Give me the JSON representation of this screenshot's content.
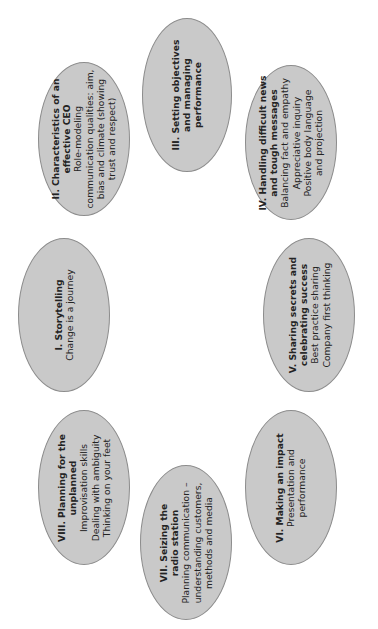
{
  "diagram": {
    "type": "cycle",
    "orientation": "rotated-90-ccw",
    "colors": {
      "background": "#ffffff",
      "ellipse_fill": "#c9c9c9",
      "ellipse_border": "#8c8c8c",
      "text": "#232323"
    },
    "nodes": [
      {
        "id": "I",
        "title_lines": [
          "I. Storytelling"
        ],
        "body_lines": [
          "Change is a journey"
        ]
      },
      {
        "id": "II",
        "title_lines": [
          "II. Characteristics of an",
          "effective CEO"
        ],
        "body_lines": [
          "Role-modeling",
          "communication qualities: aim,",
          "bias and climate (showing",
          "trust and respect)"
        ]
      },
      {
        "id": "III",
        "title_lines": [
          "III. Setting objectives",
          "and managing",
          "performance"
        ],
        "body_lines": []
      },
      {
        "id": "IV",
        "title_lines": [
          "IV. Handling difficult news",
          "and tough messages"
        ],
        "body_lines": [
          "Balancing fact and empathy",
          "Appreciative inquiry",
          "Positive body language",
          "and projection"
        ]
      },
      {
        "id": "V",
        "title_lines": [
          "V. Sharing secrets and",
          "celebrating success"
        ],
        "body_lines": [
          "Best practice sharing",
          "Company first thinking"
        ]
      },
      {
        "id": "VI",
        "title_lines": [
          "VI. Making an impact"
        ],
        "body_lines": [
          "Presentation and",
          "performance"
        ]
      },
      {
        "id": "VII",
        "title_lines": [
          "VII. Seizing the",
          "radio station"
        ],
        "body_lines": [
          "Planning communication –",
          "understanding customers,",
          "methods and media"
        ]
      },
      {
        "id": "VIII",
        "title_lines": [
          "VIII. Planning for the",
          "unplanned"
        ],
        "body_lines": [
          "Improvisation skills",
          "Dealing with ambiguity",
          "Thinking on your feet"
        ]
      }
    ]
  }
}
